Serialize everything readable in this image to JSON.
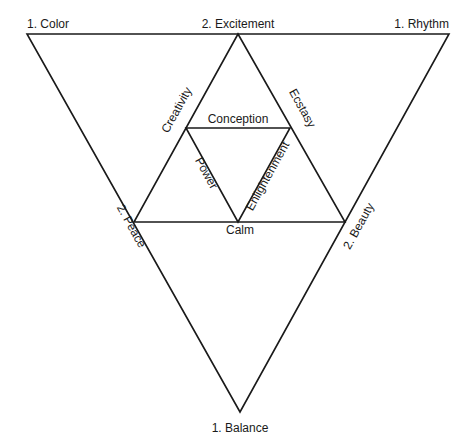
{
  "diagram": {
    "outer_vertices": {
      "top_left": "1. Color",
      "top_right": "1. Rhythm",
      "bottom": "1. Balance"
    },
    "secondary_points": {
      "top": "2. Excitement",
      "left": "2. Peace",
      "right": "2. Beauty"
    },
    "inner_edges": {
      "left": "Creativity",
      "right": "Ecstasy",
      "top": "Conception",
      "bottom": "Calm",
      "center_left": "Power",
      "center_right": "Enlightenment"
    },
    "colors": {
      "line": "#1a1a1a",
      "background": "#ffffff"
    }
  }
}
